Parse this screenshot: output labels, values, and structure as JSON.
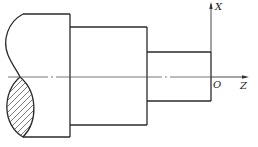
{
  "diagram": {
    "type": "stepped-shaft-turning-coordinate-system",
    "axes": {
      "x_label": "X",
      "z_label": "Z",
      "origin_label": "O"
    },
    "sections": [
      {
        "name": "large-diameter",
        "x_start": 23,
        "x_end": 70,
        "top": 14,
        "bottom": 137
      },
      {
        "name": "middle-diameter",
        "x_start": 70,
        "x_end": 147,
        "top": 27,
        "bottom": 125
      },
      {
        "name": "small-diameter",
        "x_start": 147,
        "x_end": 211,
        "top": 52,
        "bottom": 101
      }
    ],
    "centerline_y": 77,
    "colors": {
      "line": "#2a2a2a",
      "background": "#ffffff"
    }
  }
}
